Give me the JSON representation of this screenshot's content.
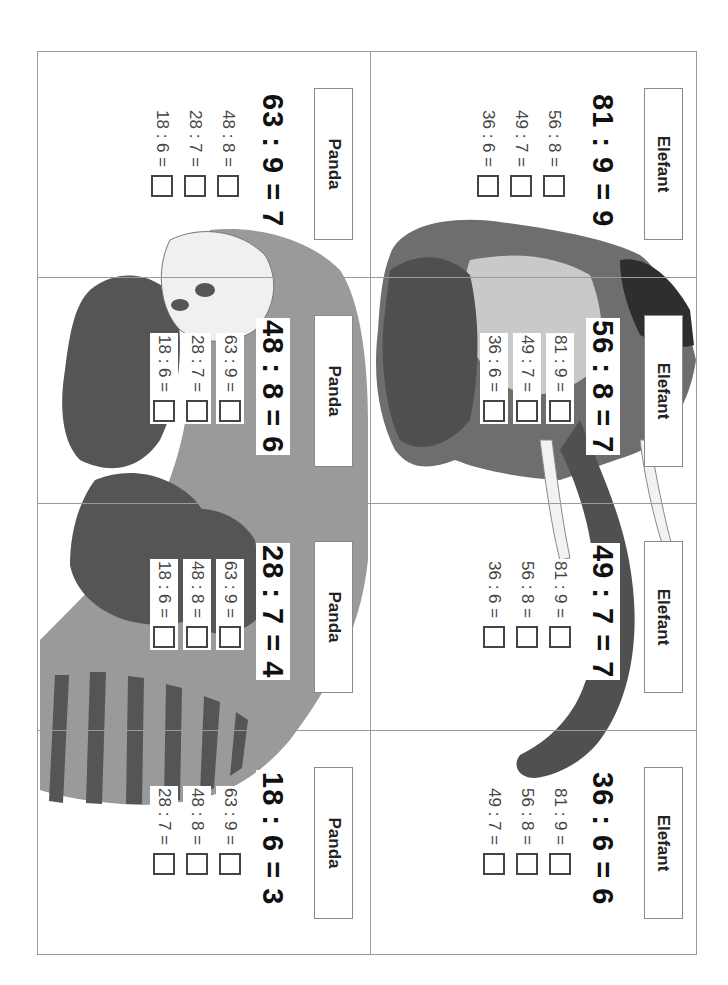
{
  "worksheet": {
    "orientation": "rotated 90deg clockwise",
    "columns": [
      {
        "animal": "Elefant",
        "panels": [
          {
            "label": "Elefant",
            "main_equation": "81 : 9 = 9",
            "exercises": [
              {
                "expr": "56 : 8 =",
                "answer": ""
              },
              {
                "expr": "49 : 7 =",
                "answer": ""
              },
              {
                "expr": "36 : 6 =",
                "answer": ""
              }
            ]
          },
          {
            "label": "Elefant",
            "main_equation": "56 : 8 = 7",
            "exercises": [
              {
                "expr": "81 : 9 =",
                "answer": ""
              },
              {
                "expr": "49 : 7 =",
                "answer": ""
              },
              {
                "expr": "36 : 6 =",
                "answer": ""
              }
            ]
          },
          {
            "label": "Elefant",
            "main_equation": "49 : 7 = 7",
            "exercises": [
              {
                "expr": "81 : 9 =",
                "answer": ""
              },
              {
                "expr": "56 : 8 =",
                "answer": ""
              },
              {
                "expr": "36 : 6 =",
                "answer": ""
              }
            ]
          },
          {
            "label": "Elefant",
            "main_equation": "36 : 6 = 6",
            "exercises": [
              {
                "expr": "81 : 9 =",
                "answer": ""
              },
              {
                "expr": "56 : 8 =",
                "answer": ""
              },
              {
                "expr": "49 : 7 =",
                "answer": ""
              }
            ]
          }
        ]
      },
      {
        "animal": "Panda",
        "panels": [
          {
            "label": "Panda",
            "main_equation": "63 : 9 = 7",
            "exercises": [
              {
                "expr": "48 : 8 =",
                "answer": ""
              },
              {
                "expr": "28 : 7 =",
                "answer": ""
              },
              {
                "expr": "18 : 6 =",
                "answer": ""
              }
            ]
          },
          {
            "label": "Panda",
            "main_equation": "48 : 8 = 6",
            "exercises": [
              {
                "expr": "63 : 9 =",
                "answer": ""
              },
              {
                "expr": "28 : 7 =",
                "answer": ""
              },
              {
                "expr": "18 : 6 =",
                "answer": ""
              }
            ]
          },
          {
            "label": "Panda",
            "main_equation": "28 : 7 = 4",
            "exercises": [
              {
                "expr": "63 : 9 =",
                "answer": ""
              },
              {
                "expr": "48 : 8 =",
                "answer": ""
              },
              {
                "expr": "18 : 6 =",
                "answer": ""
              }
            ]
          },
          {
            "label": "Panda",
            "main_equation": "18 : 6 = 3",
            "exercises": [
              {
                "expr": "63 : 9 =",
                "answer": ""
              },
              {
                "expr": "48 : 8 =",
                "answer": ""
              },
              {
                "expr": "28 : 7 =",
                "answer": ""
              }
            ]
          }
        ]
      }
    ]
  },
  "colors": {
    "border": "#9a9a9a",
    "ink": "#111111",
    "light_gray": "#9a9a9a",
    "dark_gray": "#555555"
  }
}
